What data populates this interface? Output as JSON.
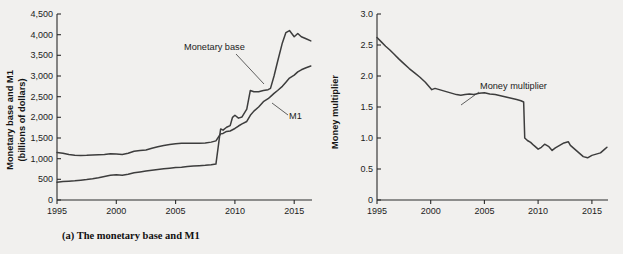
{
  "figure": {
    "background_color": "#f1f0ee",
    "line_color": "#3d3d3d"
  },
  "panel_a": {
    "caption": "(a) The monetary base and M1",
    "y_axis_label_line1": "Monetary base and M1",
    "y_axis_label_line2": "(billions of dollars)",
    "annotation_monetary_base": "Monetary base",
    "annotation_m1": "M1",
    "y_ticks": [
      "0",
      "500",
      "1,000",
      "1,500",
      "2,000",
      "2,500",
      "3,000",
      "3,500",
      "4,000",
      "4,500"
    ],
    "x_ticks": [
      "1995",
      "2000",
      "2005",
      "2010",
      "2015"
    ]
  },
  "panel_b": {
    "caption": "(b) The money multiplier",
    "y_axis_label": "Money multiplier",
    "annotation_multiplier": "Money multiplier",
    "y_ticks": [
      "0",
      "0.5",
      "1.0",
      "1.5",
      "2.0",
      "2.5",
      "3.0"
    ],
    "x_ticks": [
      "1995",
      "2000",
      "2005",
      "2010",
      "2015"
    ]
  },
  "chart_data": [
    {
      "type": "line",
      "title": "(a) The monetary base and M1",
      "xlabel": "",
      "ylabel": "Monetary base and M1 (billions of dollars)",
      "xlim": [
        1995,
        2016.5
      ],
      "ylim": [
        0,
        4500
      ],
      "grid": false,
      "legend": "inline annotations",
      "x": [
        1995.0,
        1995.5,
        1996.0,
        1996.5,
        1997.0,
        1997.5,
        1998.0,
        1998.5,
        1999.0,
        1999.5,
        2000.0,
        2000.5,
        2001.0,
        2001.5,
        2002.0,
        2002.5,
        2003.0,
        2003.5,
        2004.0,
        2004.5,
        2005.0,
        2005.5,
        2006.0,
        2006.5,
        2007.0,
        2007.5,
        2008.0,
        2008.4,
        2008.7,
        2008.8,
        2009.0,
        2009.3,
        2009.6,
        2009.8,
        2010.0,
        2010.3,
        2010.6,
        2011.0,
        2011.3,
        2011.6,
        2012.0,
        2012.4,
        2012.8,
        2013.0,
        2013.3,
        2013.6,
        2014.0,
        2014.3,
        2014.6,
        2015.0,
        2015.3,
        2015.6,
        2016.0,
        2016.4
      ],
      "series": [
        {
          "name": "Monetary base",
          "values": [
            430,
            445,
            455,
            465,
            480,
            495,
            515,
            540,
            570,
            600,
            610,
            600,
            625,
            660,
            680,
            700,
            720,
            740,
            755,
            770,
            785,
            795,
            810,
            820,
            830,
            840,
            855,
            870,
            1520,
            1720,
            1690,
            1760,
            1800,
            2000,
            2050,
            1980,
            2010,
            2200,
            2650,
            2620,
            2620,
            2650,
            2670,
            2700,
            3000,
            3350,
            3800,
            4050,
            4100,
            3950,
            4030,
            3950,
            3900,
            3850
          ]
        },
        {
          "name": "M1",
          "values": [
            1150,
            1130,
            1100,
            1085,
            1075,
            1080,
            1090,
            1095,
            1100,
            1120,
            1110,
            1100,
            1130,
            1180,
            1200,
            1210,
            1250,
            1290,
            1320,
            1340,
            1360,
            1370,
            1375,
            1370,
            1375,
            1380,
            1400,
            1430,
            1560,
            1600,
            1610,
            1660,
            1670,
            1700,
            1730,
            1790,
            1840,
            1900,
            2050,
            2150,
            2250,
            2380,
            2450,
            2500,
            2580,
            2650,
            2750,
            2850,
            2950,
            3020,
            3100,
            3150,
            3200,
            3240
          ]
        }
      ]
    },
    {
      "type": "line",
      "title": "(b) The money multiplier",
      "xlabel": "",
      "ylabel": "Money multiplier",
      "xlim": [
        1995,
        2016.5
      ],
      "ylim": [
        0,
        3.0
      ],
      "grid": false,
      "legend": "inline annotation",
      "x": [
        1995.0,
        1995.4,
        1995.8,
        1996.2,
        1996.6,
        1997.0,
        1997.5,
        1998.0,
        1998.5,
        1999.0,
        1999.5,
        1999.9,
        2000.1,
        2000.4,
        2000.8,
        2001.2,
        2001.6,
        2002.0,
        2002.4,
        2002.8,
        2003.2,
        2003.6,
        2004.0,
        2004.5,
        2005.0,
        2005.5,
        2006.0,
        2006.5,
        2007.0,
        2007.5,
        2008.0,
        2008.4,
        2008.65,
        2008.75,
        2009.0,
        2009.3,
        2009.6,
        2010.0,
        2010.3,
        2010.6,
        2011.0,
        2011.3,
        2011.6,
        2012.0,
        2012.4,
        2012.8,
        2013.0,
        2013.4,
        2013.8,
        2014.2,
        2014.6,
        2015.0,
        2015.4,
        2015.8,
        2016.2,
        2016.4
      ],
      "series": [
        {
          "name": "Money multiplier",
          "values": [
            2.62,
            2.55,
            2.48,
            2.42,
            2.35,
            2.28,
            2.2,
            2.12,
            2.05,
            1.98,
            1.9,
            1.82,
            1.78,
            1.8,
            1.78,
            1.76,
            1.74,
            1.72,
            1.7,
            1.69,
            1.7,
            1.71,
            1.7,
            1.72,
            1.73,
            1.71,
            1.7,
            1.68,
            1.66,
            1.64,
            1.62,
            1.6,
            1.58,
            1.0,
            0.96,
            0.93,
            0.88,
            0.82,
            0.85,
            0.9,
            0.86,
            0.8,
            0.84,
            0.88,
            0.92,
            0.94,
            0.88,
            0.82,
            0.76,
            0.7,
            0.68,
            0.72,
            0.74,
            0.76,
            0.82,
            0.85
          ]
        }
      ]
    }
  ]
}
